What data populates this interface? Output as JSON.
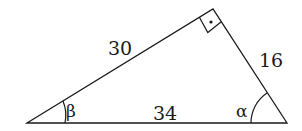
{
  "diagram": {
    "type": "right-triangle",
    "vertices": {
      "left": {
        "x": 27,
        "y": 123
      },
      "right": {
        "x": 287,
        "y": 123
      },
      "top": {
        "x": 213,
        "y": 9
      }
    },
    "sides": [
      {
        "name": "hypotenuse",
        "label": "34"
      },
      {
        "name": "left-leg",
        "label": "30"
      },
      {
        "name": "right-leg",
        "label": "16"
      }
    ],
    "angles": [
      {
        "name": "beta",
        "label": "β"
      },
      {
        "name": "alpha",
        "label": "α"
      }
    ],
    "right_angle_marker": "square-with-dot",
    "stroke_color": "#1a1a1a",
    "background": "#ffffff"
  }
}
